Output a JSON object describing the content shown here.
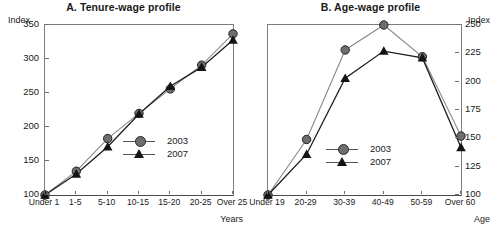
{
  "figure": {
    "index_label_left": "Index",
    "index_label_right": "Index"
  },
  "chart_data": [
    {
      "panel": "A",
      "type": "line",
      "title": "A. Tenure-wage profile",
      "xlabel": "Years",
      "ylabel": "Index",
      "categories": [
        "Under 1",
        "1-5",
        "5-10",
        "10-15",
        "15-20",
        "20-25",
        "Over 25"
      ],
      "ylim": [
        100,
        350
      ],
      "yticks": [
        100,
        150,
        200,
        250,
        300,
        350
      ],
      "grid": false,
      "legend_position": "inside-lower-right",
      "series": [
        {
          "name": "2003",
          "marker": "circle",
          "color": "#6e6e6e",
          "values": [
            100,
            135,
            183,
            220,
            256,
            291,
            337
          ]
        },
        {
          "name": "2007",
          "marker": "triangle",
          "color": "#141414",
          "values": [
            100,
            131,
            171,
            219,
            260,
            288,
            328
          ]
        }
      ]
    },
    {
      "panel": "B",
      "type": "line",
      "title": "B. Age-wage profile",
      "xlabel": "Age",
      "ylabel": "Index",
      "categories": [
        "Under 19",
        "20-29",
        "30-39",
        "40-49",
        "50-59",
        "Over 60"
      ],
      "ylim": [
        100,
        250
      ],
      "yticks": [
        100,
        125,
        150,
        175,
        200,
        225,
        250
      ],
      "grid": false,
      "legend_position": "inside-lower-center",
      "series": [
        {
          "name": "2003",
          "marker": "circle",
          "color": "#6e6e6e",
          "values": [
            100,
            149,
            228,
            250,
            222,
            152
          ]
        },
        {
          "name": "2007",
          "marker": "triangle",
          "color": "#141414",
          "values": [
            100,
            136,
            203,
            227,
            221,
            142
          ]
        }
      ]
    }
  ]
}
